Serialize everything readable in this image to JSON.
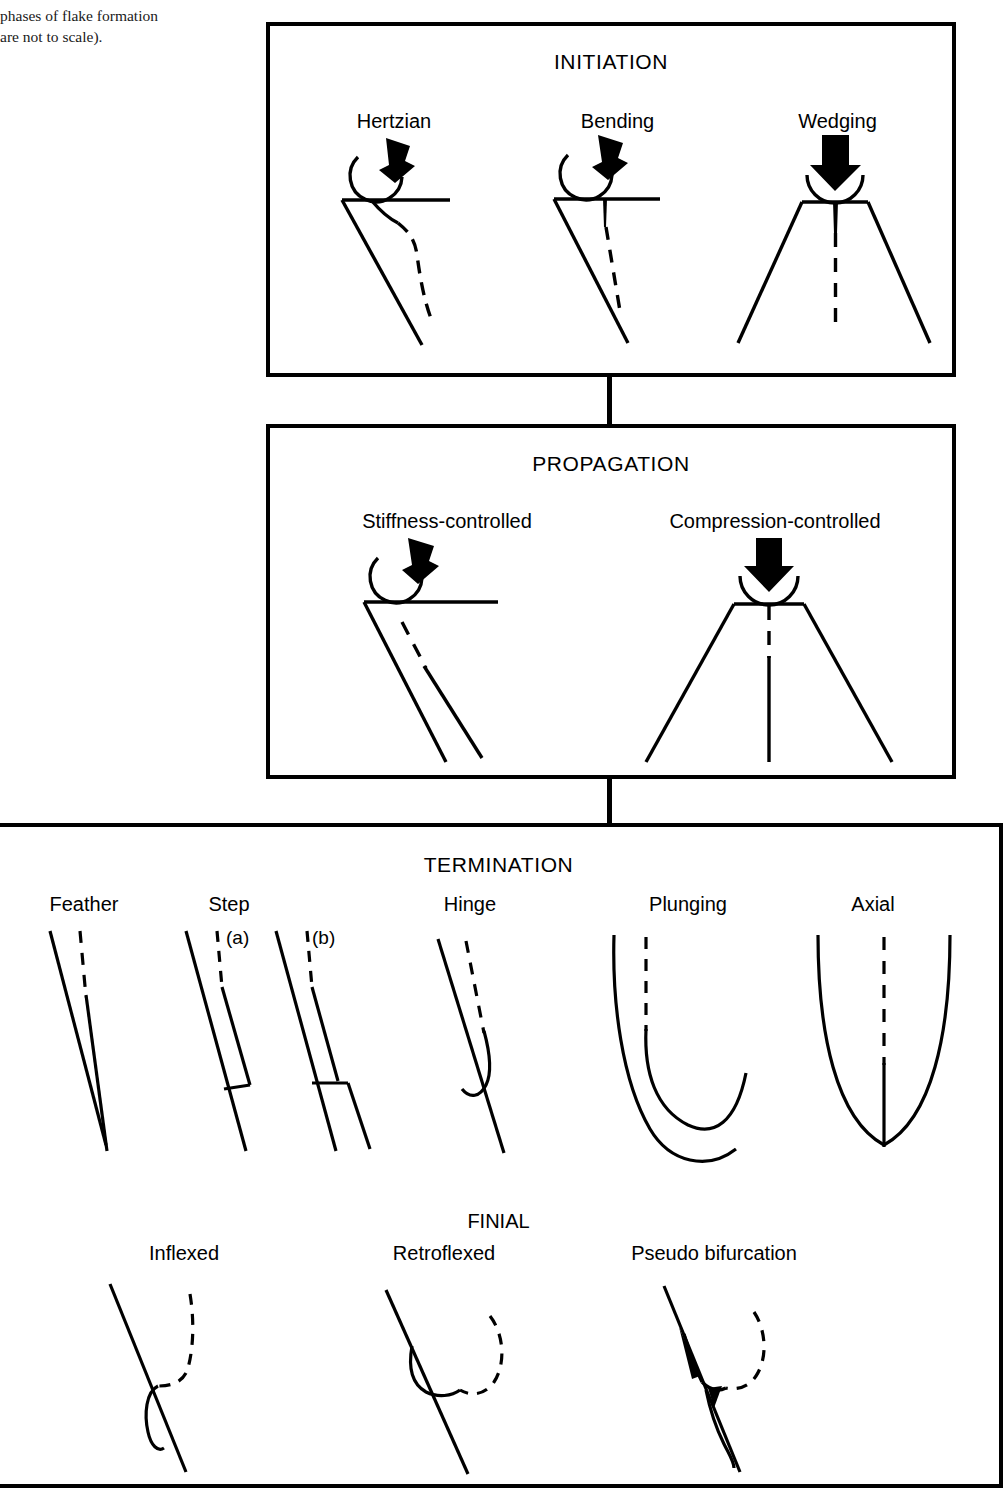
{
  "caption": {
    "line1": "phases of flake formation",
    "line2": "are not to scale)."
  },
  "diagram": {
    "title_initiation": "INITIATION",
    "title_propagation": "PROPAGATION",
    "title_termination": "TERMINATION",
    "finial_title": "FINIAL"
  },
  "initiation": {
    "items": [
      {
        "label": "Hertzian"
      },
      {
        "label": "Bending"
      },
      {
        "label": "Wedging"
      }
    ]
  },
  "propagation": {
    "items": [
      {
        "label": "Stiffness-controlled"
      },
      {
        "label": "Compression-controlled"
      }
    ]
  },
  "termination": {
    "items": [
      {
        "label": "Feather"
      },
      {
        "label": "Step",
        "sub_a": "(a)",
        "sub_b": "(b)"
      },
      {
        "label": "Hinge"
      },
      {
        "label": "Plunging"
      },
      {
        "label": "Axial"
      }
    ]
  },
  "finial": {
    "items": [
      {
        "label": "Inflexed"
      },
      {
        "label": "Retroflexed"
      },
      {
        "label": "Pseudo bifurcation"
      }
    ]
  },
  "colors": {
    "ink": "#000000",
    "paper": "#ffffff"
  }
}
